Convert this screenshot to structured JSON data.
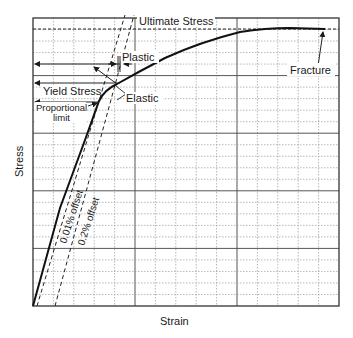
{
  "chart_data": {
    "type": "line",
    "title": "",
    "xlabel": "Strain",
    "ylabel": "Stress",
    "grid": true,
    "grid_minor_x": 15,
    "grid_minor_y": 25,
    "grid_major_every": 5,
    "series": [
      {
        "name": "Stress-strain curve",
        "style": "solid",
        "points_px": [
          [
            33,
            306
          ],
          [
            60,
            208
          ],
          [
            85,
            140
          ],
          [
            99,
            101
          ],
          [
            105,
            92
          ],
          [
            117,
            84
          ],
          [
            135,
            73
          ],
          [
            160,
            60
          ],
          [
            200,
            41
          ],
          [
            240,
            32
          ],
          [
            280,
            29
          ],
          [
            325,
            29
          ]
        ]
      },
      {
        "name": "0.01% offset",
        "style": "dashed",
        "points_px": [
          [
            37,
            306
          ],
          [
            125,
            15
          ]
        ]
      },
      {
        "name": "0.2% offset",
        "style": "dashed",
        "points_px": [
          [
            55,
            306
          ],
          [
            134,
            15
          ]
        ]
      },
      {
        "name": "Ultimate Stress line",
        "style": "dashed",
        "points_px": [
          [
            33,
            29
          ],
          [
            339,
            29
          ]
        ]
      }
    ],
    "annotations": [
      {
        "text": "Ultimate Stress",
        "x": 139,
        "y": 24
      },
      {
        "text": "Plastic",
        "x": 122,
        "y": 60
      },
      {
        "text": "Yield Stress",
        "x": 44,
        "y": 91
      },
      {
        "text": "Elastic",
        "x": 126,
        "y": 98
      },
      {
        "text": "Proportional",
        "x": 36,
        "y": 108
      },
      {
        "text": "limit",
        "x": 55,
        "y": 119
      },
      {
        "text": "0.01% offset",
        "rotate": -70
      },
      {
        "text": "0.2% offset",
        "rotate": -70
      },
      {
        "text": "Fracture",
        "x": 290,
        "y": 73
      }
    ]
  },
  "labels": {
    "ultimate": "Ultimate Stress",
    "plastic": "Plastic",
    "yield": "Yield Stress",
    "elastic": "Elastic",
    "proportional": "Proportional",
    "limit": "limit",
    "offset1": "0.01% offset",
    "offset2": "0.2% offset",
    "fracture": "Fracture",
    "xlabel": "Strain",
    "ylabel": "Stress"
  }
}
